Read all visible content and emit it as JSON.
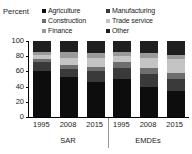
{
  "axis": {
    "y_label": "Percent",
    "ticks": [
      100,
      80,
      60,
      40,
      20,
      0
    ]
  },
  "legend": {
    "items": [
      {
        "label": "Agriculture",
        "color": "#0d0d0d",
        "column": "left"
      },
      {
        "label": "Manufacturing",
        "color": "#3a3a3a",
        "column": "right"
      },
      {
        "label": "Construction",
        "color": "#6e6e6e",
        "column": "left"
      },
      {
        "label": "Trade service",
        "color": "#c4c4c4",
        "column": "right"
      },
      {
        "label": "Finance",
        "color": "#9a9a9a",
        "column": "left"
      },
      {
        "label": "Other",
        "color": "#1f1f1f",
        "column": "right"
      }
    ]
  },
  "groups": [
    {
      "name": "SAR",
      "years": [
        "1995",
        "2008",
        "2015"
      ]
    },
    {
      "name": "EMDEs",
      "years": [
        "1995",
        "2008",
        "2015"
      ]
    }
  ],
  "chart_data": {
    "type": "bar",
    "stacked": true,
    "normalized_to_100": true,
    "title": "",
    "xlabel": "",
    "ylabel": "Percent",
    "ylim": [
      0,
      100
    ],
    "yticks": [
      0,
      20,
      40,
      60,
      80,
      100
    ],
    "grid": false,
    "legend_position": "top",
    "categories": [
      "SAR 1995",
      "SAR 2008",
      "SAR 2015",
      "EMDEs 1995",
      "EMDEs 2008",
      "EMDEs 2015"
    ],
    "group_labels": [
      "SAR",
      "EMDEs"
    ],
    "x_tick_labels": [
      "1995",
      "2008",
      "2015",
      "1995",
      "2008",
      "2015"
    ],
    "series": [
      {
        "name": "Agriculture",
        "color": "#0d0d0d",
        "values": [
          60,
          52,
          46,
          50,
          40,
          34
        ]
      },
      {
        "name": "Manufacturing",
        "color": "#3a3a3a",
        "values": [
          12,
          11,
          14,
          15,
          17,
          16
        ]
      },
      {
        "name": "Construction",
        "color": "#6e6e6e",
        "values": [
          4,
          5,
          6,
          7,
          8,
          8
        ]
      },
      {
        "name": "Trade service",
        "color": "#c4c4c4",
        "values": [
          6,
          10,
          12,
          8,
          13,
          18
        ]
      },
      {
        "name": "Finance",
        "color": "#9a9a9a",
        "values": [
          4,
          7,
          6,
          6,
          6,
          6
        ]
      },
      {
        "name": "Other",
        "color": "#1f1f1f",
        "values": [
          14,
          15,
          16,
          14,
          16,
          18
        ]
      }
    ]
  }
}
